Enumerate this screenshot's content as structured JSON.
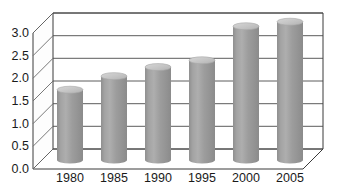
{
  "chart_data": {
    "type": "bar",
    "title": "",
    "subtitle": "",
    "xlabel": "",
    "ylabel": "",
    "categories": [
      "1980",
      "1985",
      "1990",
      "1995",
      "2000",
      "2005"
    ],
    "values": [
      1.55,
      1.85,
      2.05,
      2.2,
      2.95,
      3.05
    ],
    "series": [
      {
        "name": "",
        "values": [
          1.55,
          1.85,
          2.05,
          2.2,
          2.95,
          3.05
        ]
      }
    ],
    "ylim": [
      0.0,
      3.0
    ],
    "ytick_labels": [
      "0.0",
      "0.5",
      "1.0",
      "1.5",
      "2.0",
      "2.5",
      "3.0"
    ],
    "ytick_values": [
      0.0,
      0.5,
      1.0,
      1.5,
      2.0,
      2.5,
      3.0
    ],
    "grid": true,
    "legend": false,
    "legend_position": "none",
    "style": "3d-cylinder",
    "bar_color": "#9a9a9a",
    "bar_top_color": "#c9c9c9",
    "bar_shade_light": "#b4b4b4",
    "bar_shade_dark": "#8a8a8a",
    "axis_color": "#3a3a3a",
    "grid_color": "#4a4a4a",
    "background": "#ffffff",
    "annotations": []
  }
}
